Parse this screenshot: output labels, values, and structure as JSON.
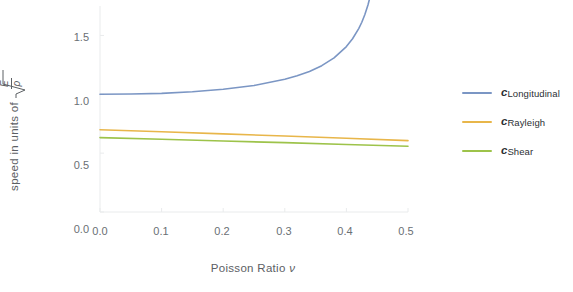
{
  "chart_data": {
    "type": "line",
    "title": "",
    "xlabel": "Poisson Ratio ν",
    "ylabel": "speed in units of √(E/ρ)",
    "ylabel_parts": {
      "prefix": "speed  in  units  of",
      "radical_numerator": "E",
      "radical_denominator": "ρ"
    },
    "xlim": [
      0.0,
      0.5
    ],
    "ylim": [
      0.0,
      1.75
    ],
    "grid": false,
    "legend_position": "right",
    "xticks": [
      "0.0",
      "0.1",
      "0.2",
      "0.3",
      "0.4",
      "0.5"
    ],
    "xtick_values": [
      0.0,
      0.1,
      0.2,
      0.3,
      0.4,
      0.5
    ],
    "yticks": [
      "0.0",
      "0.5",
      "1.0",
      "1.5"
    ],
    "ytick_values": [
      0.0,
      0.5,
      1.0,
      1.5
    ],
    "x": [
      0.0,
      0.05,
      0.1,
      0.15,
      0.2,
      0.25,
      0.3,
      0.32,
      0.34,
      0.36,
      0.38,
      0.4,
      0.41,
      0.42,
      0.425,
      0.43,
      0.435,
      0.44,
      0.445,
      0.45,
      0.455,
      0.46,
      0.47,
      0.48,
      0.49,
      0.5
    ],
    "series": [
      {
        "name": "c_Longitudinal",
        "label_base": "c",
        "label_sub": "Longitudinal",
        "color": "#7b96c4",
        "x": [
          0.0,
          0.05,
          0.1,
          0.15,
          0.2,
          0.25,
          0.3,
          0.32,
          0.34,
          0.36,
          0.38,
          0.4,
          0.41,
          0.42,
          0.425,
          0.43,
          0.435,
          0.44
        ],
        "values": [
          1.0,
          1.002,
          1.008,
          1.021,
          1.043,
          1.075,
          1.127,
          1.157,
          1.194,
          1.243,
          1.309,
          1.405,
          1.472,
          1.558,
          1.612,
          1.678,
          1.758,
          1.86
        ],
        "clipped_at_top": true
      },
      {
        "name": "c_Rayleigh",
        "label_base": "c",
        "label_sub": "Rayleigh",
        "color": "#e8b64a",
        "x": [
          0.0,
          0.1,
          0.2,
          0.3,
          0.4,
          0.5
        ],
        "values": [
          0.699,
          0.682,
          0.664,
          0.645,
          0.626,
          0.606
        ]
      },
      {
        "name": "c_Shear",
        "label_base": "c",
        "label_sub": "Shear",
        "color": "#9dc34a",
        "x": [
          0.0,
          0.1,
          0.2,
          0.3,
          0.4,
          0.5
        ],
        "values": [
          0.632,
          0.618,
          0.603,
          0.589,
          0.574,
          0.559
        ]
      }
    ]
  },
  "legend": {
    "items": [
      {
        "base": "c",
        "sub": "Longitudinal",
        "color": "#7b96c4"
      },
      {
        "base": "c",
        "sub": "Rayleigh",
        "color": "#e8b64a"
      },
      {
        "base": "c",
        "sub": "Shear",
        "color": "#9dc34a"
      }
    ]
  },
  "axis": {
    "x_title_text": "Poisson Ratio",
    "x_title_symbol": "ν",
    "y_title_prefix": "speed  in  units  of",
    "y_radical_num": "E",
    "y_radical_den": "ρ"
  }
}
